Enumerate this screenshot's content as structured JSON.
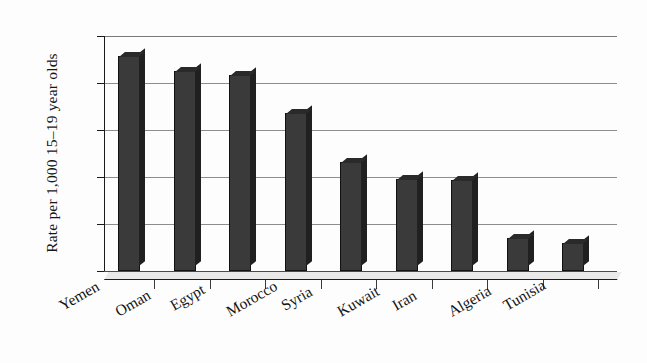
{
  "chart_data": {
    "type": "bar",
    "title": "",
    "xlabel": "",
    "ylabel": "Rate per 1,000 15–19 year olds",
    "ylim": [
      0,
      50
    ],
    "yticks": [
      0,
      10,
      20,
      30,
      40,
      50
    ],
    "grid": true,
    "legend": "none",
    "categories": [
      "Yemen",
      "Oman",
      "Egypt",
      "Morocco",
      "Syria",
      "Kuwait",
      "Iran",
      "Algeria",
      "Tunisia"
    ],
    "values": [
      45.8,
      42.6,
      41.6,
      33.6,
      23.2,
      19.5,
      19.4,
      7.0,
      6.0
    ],
    "bar_color": "#3a3a3a"
  },
  "axis": {
    "ylabel": "Rate per 1,000 15–19 year olds",
    "tick_labels": [
      "50",
      "40",
      "30",
      "20",
      "10",
      "0"
    ]
  }
}
